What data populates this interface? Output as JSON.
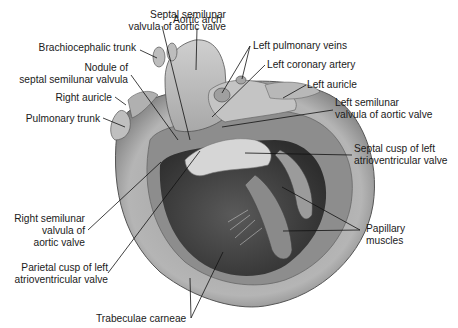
{
  "figure": {
    "labels": [
      {
        "id": "septal-semilunar",
        "lines": [
          "Septal semilunar",
          "valvula of aortic valve"
        ]
      },
      {
        "id": "aortic-arch",
        "lines": [
          "Aortic arch"
        ]
      },
      {
        "id": "brachiocephalic",
        "lines": [
          "Brachiocephalic trunk"
        ]
      },
      {
        "id": "nodule",
        "lines": [
          "Nodule of",
          "septal semilunar valvula"
        ]
      },
      {
        "id": "right-auricle",
        "lines": [
          "Right auricle"
        ]
      },
      {
        "id": "pulmonary-trunk",
        "lines": [
          "Pulmonary trunk"
        ]
      },
      {
        "id": "left-pulmonary-veins",
        "lines": [
          "Left pulmonary veins"
        ]
      },
      {
        "id": "left-coronary",
        "lines": [
          "Left coronary artery"
        ]
      },
      {
        "id": "left-auricle",
        "lines": [
          "Left auricle"
        ]
      },
      {
        "id": "left-semilunar",
        "lines": [
          "Left semilunar",
          "valvula of aortic valve"
        ]
      },
      {
        "id": "septal-cusp",
        "lines": [
          "Septal cusp of left",
          "atrioventricular valve"
        ]
      },
      {
        "id": "papillary",
        "lines": [
          "Papillary",
          "muscles"
        ]
      },
      {
        "id": "right-semilunar",
        "lines": [
          "Right semilunar",
          "valvula of",
          "aortic valve"
        ]
      },
      {
        "id": "parietal-cusp",
        "lines": [
          "Parietal cusp of left",
          "atrioventricular valve"
        ]
      },
      {
        "id": "trabeculae",
        "lines": [
          "Trabeculae carneae"
        ]
      }
    ]
  }
}
